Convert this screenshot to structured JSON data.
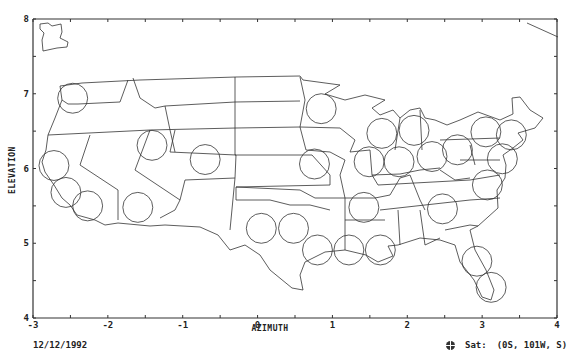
{
  "chart_data": {
    "type": "scatter",
    "title": "",
    "xlabel": "AZIMUTH",
    "ylabel": "ELEVATION",
    "xlim": [
      -3,
      4
    ],
    "ylim": [
      4,
      8
    ],
    "x_ticks": [
      "-3",
      "-2",
      "-1",
      "0",
      "1",
      "2",
      "3",
      "4"
    ],
    "y_ticks": [
      "4",
      "5",
      "6",
      "7",
      "8"
    ],
    "grid": false,
    "background_map": "Contiguous United States state boundaries",
    "marker": "open circle (spot beam footprint)",
    "beam_radius_units": 0.2,
    "points": [
      {
        "x": -2.47,
        "y": 6.94
      },
      {
        "x": -2.72,
        "y": 6.04
      },
      {
        "x": -2.56,
        "y": 5.68
      },
      {
        "x": -2.27,
        "y": 5.5
      },
      {
        "x": -1.6,
        "y": 5.48
      },
      {
        "x": -1.41,
        "y": 6.31
      },
      {
        "x": -0.7,
        "y": 6.12
      },
      {
        "x": 0.05,
        "y": 5.2
      },
      {
        "x": 0.48,
        "y": 5.2
      },
      {
        "x": 0.8,
        "y": 4.91
      },
      {
        "x": 1.22,
        "y": 4.91
      },
      {
        "x": 1.64,
        "y": 4.91
      },
      {
        "x": 0.76,
        "y": 6.06
      },
      {
        "x": 0.85,
        "y": 6.8
      },
      {
        "x": 1.42,
        "y": 5.48
      },
      {
        "x": 1.49,
        "y": 6.09
      },
      {
        "x": 1.66,
        "y": 6.47
      },
      {
        "x": 1.89,
        "y": 6.09
      },
      {
        "x": 2.09,
        "y": 6.51
      },
      {
        "x": 2.33,
        "y": 6.16
      },
      {
        "x": 2.67,
        "y": 6.25
      },
      {
        "x": 3.05,
        "y": 6.49
      },
      {
        "x": 3.39,
        "y": 6.45
      },
      {
        "x": 3.27,
        "y": 6.13
      },
      {
        "x": 3.07,
        "y": 5.78
      },
      {
        "x": 2.47,
        "y": 5.46
      },
      {
        "x": 2.93,
        "y": 4.76
      },
      {
        "x": 3.12,
        "y": 4.41
      }
    ]
  },
  "footer": {
    "date": "12/12/1992",
    "sat_icon": "globe-icon",
    "sat_label": "Sat:",
    "sat_value": "(0S, 101W, S)"
  }
}
